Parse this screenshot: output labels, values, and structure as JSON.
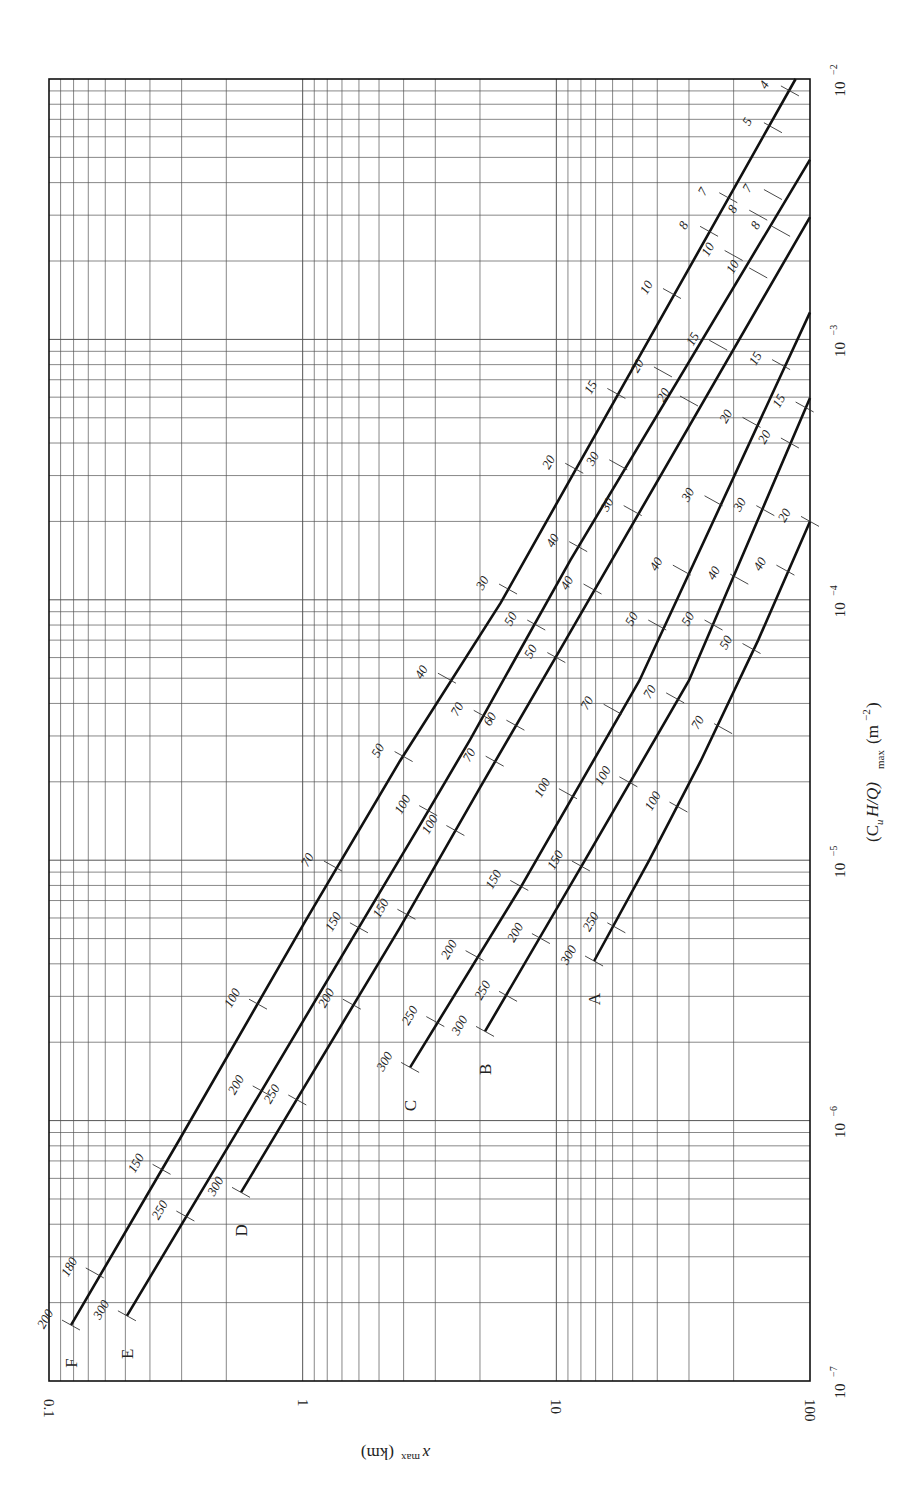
{
  "chart_data": {
    "type": "line",
    "title": "",
    "orientation": "rotated 90deg clockwise (x-axis vertical on right, y-axis horizontal along bottom, reversed)",
    "xlabel": "(C_u H/Q)_max (m^-2)",
    "ylabel": "x_max (km)",
    "xscale": "log",
    "yscale": "log",
    "xlim": [
      1e-07,
      0.01
    ],
    "ylim": [
      0.1,
      100
    ],
    "x_ticks": [
      "10^-7",
      "10^-6",
      "10^-5",
      "10^-4",
      "10^-3",
      "10^-2"
    ],
    "y_ticks": [
      "0.1",
      "1",
      "10",
      "100"
    ],
    "grid": true,
    "legend": "curves labeled at endpoints: A, B, C, D, E, F (stability classes)",
    "series": [
      {
        "name": "F",
        "points": [
          [
            1.64e-07,
            81.9
          ],
          [
            8.5e-07,
            30.5
          ],
          [
            5.8e-06,
            9.8
          ],
          [
            2.4e-05,
            4.14
          ],
          [
            9.7e-05,
            1.66
          ],
          [
            0.01,
            0.114
          ]
        ],
        "annotations": [
          {
            "label": "200",
            "pos": [
              1.64e-07,
              81.9
            ]
          },
          {
            "label": "180",
            "pos": [
              2.6e-07,
              66
            ]
          },
          {
            "label": "150",
            "pos": [
              6.5e-07,
              36
            ]
          },
          {
            "label": "100",
            "pos": [
              2.8e-06,
              15
            ]
          },
          {
            "label": "70",
            "pos": [
              9.5e-06,
              7.6
            ]
          },
          {
            "label": "50",
            "pos": [
              2.5e-05,
              4.0
            ]
          },
          {
            "label": "40",
            "pos": [
              5e-05,
              2.7
            ]
          },
          {
            "label": "30",
            "pos": [
              0.00011,
              1.55
            ]
          },
          {
            "label": "20",
            "pos": [
              0.00032,
              0.85
            ]
          },
          {
            "label": "15",
            "pos": [
              0.00062,
              0.58
            ]
          },
          {
            "label": "10",
            "pos": [
              0.0015,
              0.35
            ]
          },
          {
            "label": "8",
            "pos": [
              0.0026,
              0.25
            ]
          },
          {
            "label": "7",
            "pos": [
              0.0035,
              0.21
            ]
          },
          {
            "label": "5",
            "pos": [
              0.0065,
              0.14
            ]
          },
          {
            "label": "4",
            "pos": [
              0.009,
              0.12
            ]
          }
        ]
      },
      {
        "name": "E",
        "points": [
          [
            1.78e-07,
            49.3
          ],
          [
            1.1e-06,
            16.1
          ],
          [
            1.37e-05,
            3.44
          ],
          [
            2.9e-05,
            2.19
          ],
          [
            0.000142,
            0.88
          ],
          [
            0.0049,
            0.1
          ]
        ],
        "annotations": [
          {
            "label": "300",
            "pos": [
              1.78e-07,
              49.3
            ]
          },
          {
            "label": "250",
            "pos": [
              4.3e-07,
              29
            ]
          },
          {
            "label": "200",
            "pos": [
              1.3e-06,
              14.5
            ]
          },
          {
            "label": "150",
            "pos": [
              5.5e-06,
              6.0
            ]
          },
          {
            "label": "100",
            "pos": [
              1.55e-05,
              3.2
            ]
          },
          {
            "label": "70",
            "pos": [
              3.6e-05,
              1.95
            ]
          },
          {
            "label": "50",
            "pos": [
              8e-05,
              1.2
            ]
          },
          {
            "label": "40",
            "pos": [
              0.00016,
              0.82
            ]
          },
          {
            "label": "30",
            "pos": [
              0.00033,
              0.57
            ]
          },
          {
            "label": "20",
            "pos": [
              0.00075,
              0.38
            ]
          },
          {
            "label": "10",
            "pos": [
              0.0021,
              0.2
            ]
          },
          {
            "label": "8",
            "pos": [
              0.003,
              0.16
            ]
          },
          {
            "label": "7",
            "pos": [
              0.0036,
              0.14
            ]
          }
        ]
      },
      {
        "name": "D",
        "points": [
          [
            5.3e-07,
            17.5
          ],
          [
            5.5e-06,
            4.14
          ],
          [
            1.9e-05,
            2.0
          ],
          [
            6.4e-05,
            0.97
          ],
          [
            0.00295,
            0.1
          ]
        ],
        "annotations": [
          {
            "label": "300",
            "pos": [
              5.3e-07,
              17.5
            ]
          },
          {
            "label": "250",
            "pos": [
              1.2e-06,
              10.5
            ]
          },
          {
            "label": "200",
            "pos": [
              2.8e-06,
              6.4
            ]
          },
          {
            "label": "150",
            "pos": [
              6.2e-06,
              3.9
            ]
          },
          {
            "label": "100",
            "pos": [
              1.3e-05,
              2.5
            ]
          },
          {
            "label": "70",
            "pos": [
              2.4e-05,
              1.75
            ]
          },
          {
            "label": "60",
            "pos": [
              3.3e-05,
              1.45
            ]
          },
          {
            "label": "50",
            "pos": [
              6e-05,
              1.0
            ]
          },
          {
            "label": "40",
            "pos": [
              0.00011,
              0.72
            ]
          },
          {
            "label": "30",
            "pos": [
              0.00022,
              0.5
            ]
          },
          {
            "label": "20",
            "pos": [
              0.00058,
              0.3
            ]
          },
          {
            "label": "15",
            "pos": [
              0.00095,
              0.23
            ]
          },
          {
            "label": "10",
            "pos": [
              0.0018,
              0.16
            ]
          },
          {
            "label": "8",
            "pos": [
              0.0026,
              0.13
            ]
          }
        ]
      },
      {
        "name": "C",
        "points": [
          [
            1.6e-06,
            3.77
          ],
          [
            7.8e-06,
            1.39
          ],
          [
            4.9e-05,
            0.47
          ],
          [
            0.00127,
            0.1
          ]
        ],
        "annotations": [
          {
            "label": "300",
            "pos": [
              1.6e-06,
              3.77
            ]
          },
          {
            "label": "250",
            "pos": [
              2.4e-06,
              3.0
            ]
          },
          {
            "label": "200",
            "pos": [
              4.3e-06,
              2.1
            ]
          },
          {
            "label": "150",
            "pos": [
              8e-06,
              1.4
            ]
          },
          {
            "label": "100",
            "pos": [
              1.8e-05,
              0.9
            ]
          },
          {
            "label": "70",
            "pos": [
              3.8e-05,
              0.6
            ]
          },
          {
            "label": "50",
            "pos": [
              8e-05,
              0.4
            ]
          },
          {
            "label": "40",
            "pos": [
              0.00013,
              0.32
            ]
          },
          {
            "label": "30",
            "pos": [
              0.00024,
              0.24
            ]
          },
          {
            "label": "20",
            "pos": [
              0.00048,
              0.17
            ]
          },
          {
            "label": "15",
            "pos": [
              0.0008,
              0.13
            ]
          }
        ]
      },
      {
        "name": "B",
        "points": [
          [
            2.2e-06,
            1.91
          ],
          [
            9.2e-06,
            0.81
          ],
          [
            4.9e-05,
            0.3
          ],
          [
            0.000595,
            0.1
          ]
        ],
        "annotations": [
          {
            "label": "300",
            "pos": [
              2.2e-06,
              1.91
            ]
          },
          {
            "label": "250",
            "pos": [
              3e-06,
              1.55
            ]
          },
          {
            "label": "200",
            "pos": [
              5e-06,
              1.15
            ]
          },
          {
            "label": "150",
            "pos": [
              9.5e-06,
              0.8
            ]
          },
          {
            "label": "100",
            "pos": [
              2e-05,
              0.52
            ]
          },
          {
            "label": "70",
            "pos": [
              4.2e-05,
              0.34
            ]
          },
          {
            "label": "50",
            "pos": [
              8e-05,
              0.24
            ]
          },
          {
            "label": "40",
            "pos": [
              0.00012,
              0.19
            ]
          },
          {
            "label": "30",
            "pos": [
              0.00022,
              0.15
            ]
          },
          {
            "label": "20",
            "pos": [
              0.0004,
              0.12
            ]
          },
          {
            "label": "15",
            "pos": [
              0.00055,
              0.105
            ]
          }
        ]
      },
      {
        "name": "A",
        "points": [
          [
            4.1e-06,
            0.71
          ],
          [
            1e-05,
            0.43
          ],
          [
            2.4e-05,
            0.27
          ],
          [
            7e-05,
            0.16
          ],
          [
            0.0002,
            0.1
          ]
        ],
        "annotations": [
          {
            "label": "300",
            "pos": [
              4.1e-06,
              0.71
            ]
          },
          {
            "label": "250",
            "pos": [
              5.5e-06,
              0.58
            ]
          },
          {
            "label": "100",
            "pos": [
              1.6e-05,
              0.33
            ]
          },
          {
            "label": "70",
            "pos": [
              3.2e-05,
              0.22
            ]
          },
          {
            "label": "50",
            "pos": [
              6.5e-05,
              0.17
            ]
          },
          {
            "label": "40",
            "pos": [
              0.00013,
              0.125
            ]
          },
          {
            "label": "20",
            "pos": [
              0.0002,
              0.1
            ]
          }
        ]
      }
    ]
  },
  "axes": {
    "bottom_label": "x_max (km)",
    "bottom_label_main": "x",
    "bottom_label_sub": "max",
    "bottom_label_unit": "(km)",
    "right_label_main": "(C",
    "right_label_u": "u",
    "right_label_mid": "H/Q)",
    "right_label_sub": "max",
    "right_label_unit": "(m",
    "right_label_exp": "−2",
    "right_label_close": ")"
  },
  "style": {
    "line_color": "#111111",
    "grid_color": "#555555",
    "frame_color": "#111111",
    "text_color": "#222222"
  }
}
